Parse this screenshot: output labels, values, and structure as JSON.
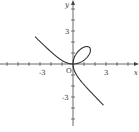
{
  "chart_data": {
    "type": "line",
    "title": "",
    "equation": "x^3 + y^3 = 3xy",
    "xlabel": "x",
    "ylabel": "y",
    "xlim": [
      -6.6,
      6.0
    ],
    "ylim": [
      -5.4,
      5.8
    ],
    "grid": false,
    "legend": null,
    "x_ticks": [
      -6,
      -5,
      -4,
      -3,
      -2,
      -1,
      1,
      2,
      3,
      4,
      5,
      6
    ],
    "y_ticks": [
      -5,
      -4,
      -3,
      -2,
      -1,
      1,
      2,
      3,
      4,
      5
    ],
    "tick_labels": {
      "x": [
        {
          "value": -3,
          "label": "-3"
        },
        {
          "value": 3,
          "label": "3"
        }
      ],
      "y": [
        {
          "value": 3,
          "label": "3"
        },
        {
          "value": -3,
          "label": "-3"
        }
      ],
      "origin": "O"
    },
    "series": [
      {
        "name": "folium of Descartes",
        "color": "#333333",
        "points_note": "parametric x=3t/(1+t^3), y=3t^2/(1+t^3); loop tip at (1.5,1.5); asymptote x+y=-1",
        "sample_points": [
          [
            -5.6,
            4.9
          ],
          [
            -4,
            3.2
          ],
          [
            -3,
            2.2
          ],
          [
            -2,
            1.3
          ],
          [
            -1,
            0.5
          ],
          [
            0,
            0
          ],
          [
            0.5,
            1.2
          ],
          [
            1.0,
            1.6
          ],
          [
            1.5,
            1.5
          ],
          [
            1.4,
            0.9
          ],
          [
            0.8,
            0.3
          ],
          [
            0,
            0
          ],
          [
            0.3,
            -1.0
          ],
          [
            1,
            -2.1
          ],
          [
            2,
            -3.0
          ],
          [
            3,
            -4.0
          ],
          [
            4.5,
            -5.4
          ]
        ]
      }
    ]
  },
  "labels": {
    "x_axis": "x",
    "y_axis": "y",
    "origin": "O",
    "x_pos": "3",
    "x_neg": "-3",
    "y_pos": "3",
    "y_neg": "-3"
  }
}
